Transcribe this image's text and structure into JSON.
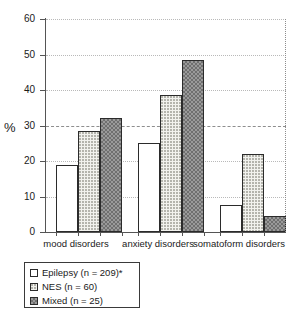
{
  "chart_data": {
    "type": "bar",
    "title": "",
    "subtitle": "",
    "xlabel": "",
    "ylabel": "%",
    "ylim": [
      0,
      60
    ],
    "yticks": [
      0,
      10,
      20,
      30,
      40,
      50,
      60
    ],
    "ytick_labels": [
      "0",
      "10",
      "20",
      "30",
      "40",
      "50",
      "60"
    ],
    "grid": true,
    "legend_position": "below-left",
    "categories": [
      "mood disorders",
      "anxiety disorders",
      "somatoform disorders"
    ],
    "series": [
      {
        "name": "Epilepsy (n = 209)*",
        "short_name": "Epilepsy",
        "n": 209,
        "pattern": "empty",
        "values": [
          19,
          25,
          7.5
        ]
      },
      {
        "name": "NES (n = 60)",
        "short_name": "NES",
        "n": 60,
        "pattern": "dots",
        "values": [
          28.5,
          38.5,
          22
        ]
      },
      {
        "name": "Mixed (n = 25)",
        "short_name": "Mixed",
        "n": 25,
        "pattern": "checker",
        "values": [
          32,
          48.5,
          4.5
        ]
      }
    ],
    "colors": {
      "axis": "#555555",
      "gridline": "#b9b9b9",
      "gridline_major": "#8e8e8e",
      "bar_outline": "#2b2b2b",
      "fill_empty": "#ffffff",
      "fill_dots": "#f2f2ee",
      "fill_checker": "#9a9a9a",
      "text": "#1a1a1a"
    }
  },
  "legend": {
    "items": [
      {
        "label": "Epilepsy (n = 209)*",
        "swatch": "empty"
      },
      {
        "label": "NES (n = 60)",
        "swatch": "dots"
      },
      {
        "label": "Mixed (n = 25)",
        "swatch": "checker"
      }
    ]
  },
  "axis": {
    "y_label": "%",
    "y_tick_0": "0",
    "y_tick_1": "10",
    "y_tick_2": "20",
    "y_tick_3": "30",
    "y_tick_4": "40",
    "y_tick_5": "50",
    "y_tick_6": "60"
  },
  "x_labels": {
    "g0": "mood disorders",
    "g1": "anxiety disorders",
    "g2": "somatoform disorders"
  }
}
